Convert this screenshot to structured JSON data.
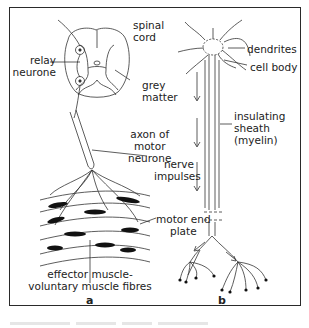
{
  "figure": {
    "panels": [
      {
        "id": "a",
        "letter": "a",
        "labels": {
          "spinal_cord_line1": "spinal",
          "spinal_cord_line2": "cord",
          "relay_line1": "relay",
          "relay_line2": "neurone",
          "grey_line1": "grey",
          "grey_line2": "matter",
          "axon_line1": "axon of",
          "axon_line2": "motor",
          "axon_line3": "neurone",
          "effector_line1": "effector muscle-",
          "effector_line2": "voluntary muscle fibres"
        }
      },
      {
        "id": "b",
        "letter": "b",
        "labels": {
          "dendrites": "dendrites",
          "cell_body": "cell body",
          "sheath_line1": "insulating",
          "sheath_line2": "sheath",
          "sheath_line3": "(myelin)",
          "impulses_line1": "nerve",
          "impulses_line2": "impulses",
          "motor_end_line1": "motor end",
          "motor_end_line2": "plate"
        }
      }
    ],
    "colors": {
      "ink": "#222222",
      "frame": "#2a2a2a",
      "background": "#ffffff"
    }
  }
}
